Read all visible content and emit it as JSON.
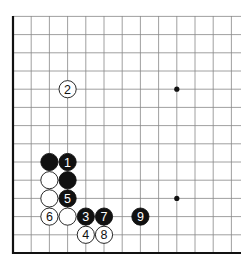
{
  "diagram": {
    "type": "go-board",
    "background": "#ffffff",
    "line_color": "#888888",
    "edge_color": "#111111",
    "black_color": "#111111",
    "white_color": "#ffffff",
    "origin_x": 13,
    "bottom_y": 253,
    "spacing": 18.2,
    "cols": 13,
    "rows": 14,
    "star_points": [
      {
        "col": 9,
        "row": 9
      },
      {
        "col": 9,
        "row": 3
      }
    ],
    "stones": [
      {
        "color": "white",
        "col": 3,
        "row": 9,
        "label": "2"
      },
      {
        "color": "black",
        "col": 2,
        "row": 5,
        "label": ""
      },
      {
        "color": "black",
        "col": 3,
        "row": 5,
        "label": "1"
      },
      {
        "color": "white",
        "col": 2,
        "row": 4,
        "label": ""
      },
      {
        "color": "black",
        "col": 3,
        "row": 4,
        "label": ""
      },
      {
        "color": "white",
        "col": 2,
        "row": 3,
        "label": ""
      },
      {
        "color": "black",
        "col": 3,
        "row": 3,
        "label": "5"
      },
      {
        "color": "white",
        "col": 2,
        "row": 2,
        "label": "6"
      },
      {
        "color": "white",
        "col": 3,
        "row": 2,
        "label": ""
      },
      {
        "color": "black",
        "col": 4,
        "row": 2,
        "label": "3"
      },
      {
        "color": "black",
        "col": 5,
        "row": 2,
        "label": "7"
      },
      {
        "color": "black",
        "col": 7,
        "row": 2,
        "label": "9"
      },
      {
        "color": "white",
        "col": 4,
        "row": 1,
        "label": "4"
      },
      {
        "color": "white",
        "col": 5,
        "row": 1,
        "label": "8"
      }
    ]
  }
}
